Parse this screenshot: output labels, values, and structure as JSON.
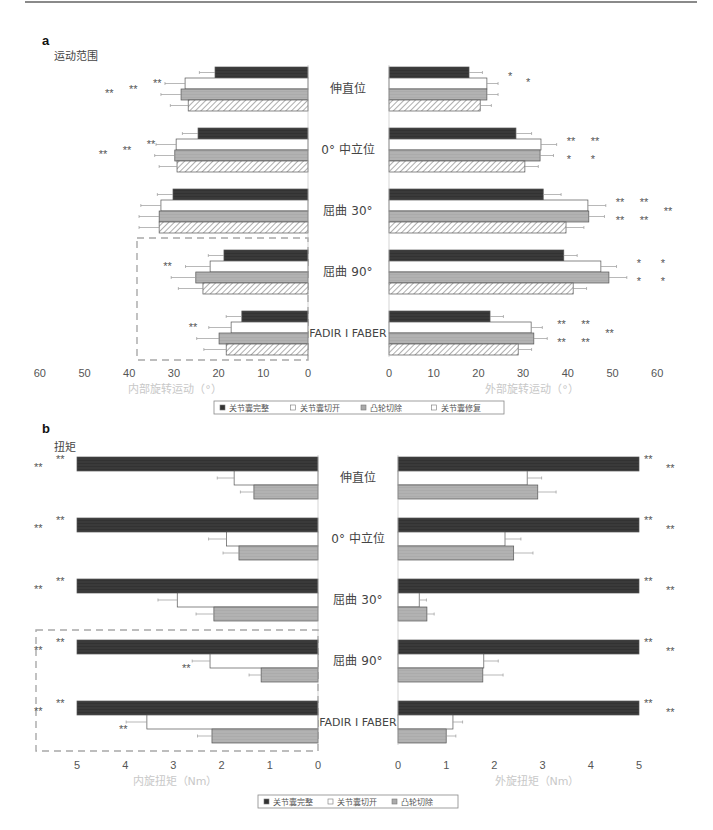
{
  "panels": {
    "a": {
      "letter": "a",
      "title": "运动范围",
      "left_axis_title": "内部旋转运动（°）",
      "right_axis_title": "外部旋转运动（°）",
      "left_ticks": [
        "60",
        "50",
        "40",
        "30",
        "20",
        "10",
        "0"
      ],
      "right_ticks": [
        "0",
        "10",
        "20",
        "30",
        "40",
        "50",
        "60"
      ],
      "legend": [
        "关节囊完整",
        "关节囊切开",
        "凸轮切除",
        "关节囊修复"
      ]
    },
    "b": {
      "letter": "b",
      "title": "扭矩",
      "left_axis_title": "内旋扭矩（Nm）",
      "right_axis_title": "外旋扭矩（Nm）",
      "left_ticks": [
        "5",
        "4",
        "3",
        "2",
        "1",
        "0"
      ],
      "right_ticks": [
        "0",
        "1",
        "2",
        "3",
        "4",
        "5"
      ],
      "legend": [
        "关节囊完整",
        "关节囊切开",
        "凸轮切除"
      ]
    }
  },
  "categories": [
    "伸直位",
    "0° 中立位",
    "屈曲 30°",
    "屈曲 90°",
    "FADIR I FABER"
  ],
  "colors": {
    "intact": "#3a3a3a",
    "capsulotomy": "#ffffff",
    "cam_resection": "#b0b0b0",
    "repair_hatch": "#6a6a6a",
    "bar_edge": "#555555",
    "dashed_box": "#a8a8a8",
    "axis_title": "#c8c8c8"
  },
  "chart_data": [
    {
      "type": "bar",
      "orientation": "horizontal-butterfly",
      "title": "运动范围",
      "panel": "a",
      "categories": [
        "伸直位",
        "0° 中立位",
        "屈曲 30°",
        "屈曲 90°",
        "FADIR I FABER"
      ],
      "left": {
        "xlabel": "内部旋转运动（°）",
        "xlim": [
          60,
          0
        ],
        "ticks": [
          60,
          50,
          40,
          30,
          20,
          10,
          0
        ],
        "series": [
          {
            "name": "关节囊完整",
            "values": [
              20.8,
              24.6,
              30.2,
              18.8,
              14.8
            ],
            "errors": [
              3.5,
              3.5,
              3.5,
              3.5,
              3.5
            ]
          },
          {
            "name": "关节囊切开",
            "values": [
              27.5,
              29.5,
              32.9,
              21.9,
              17.2
            ],
            "errors": [
              4.5,
              4.5,
              4.5,
              5.5,
              5.0
            ]
          },
          {
            "name": "凸轮切除",
            "values": [
              28.4,
              29.8,
              33.3,
              25.1,
              19.9
            ],
            "errors": [
              4.5,
              4.5,
              4.5,
              5.5,
              5.0
            ]
          },
          {
            "name": "关节囊修复",
            "values": [
              26.8,
              29.3,
              33.3,
              23.5,
              18.3
            ],
            "errors": [
              4.0,
              4.0,
              4.5,
              5.5,
              5.0
            ]
          }
        ],
        "significance": [
          "** ** **",
          "** ** **",
          "",
          "**",
          "**"
        ],
        "highlight_box": [
          "屈曲 90°",
          "FADIR I FABER"
        ]
      },
      "right": {
        "xlabel": "外部旋转运动（°）",
        "xlim": [
          0,
          60
        ],
        "ticks": [
          0,
          10,
          20,
          30,
          40,
          50,
          60
        ],
        "series": [
          {
            "name": "关节囊完整",
            "values": [
              17.9,
              28.4,
              34.5,
              39.1,
              22.6
            ],
            "errors": [
              3.0,
              3.5,
              4.0,
              3.0,
              3.0
            ]
          },
          {
            "name": "关节囊切开",
            "values": [
              21.9,
              34.0,
              44.5,
              47.4,
              31.8
            ],
            "errors": [
              2.5,
              3.5,
              4.0,
              3.5,
              2.5
            ]
          },
          {
            "name": "凸轮切除",
            "values": [
              21.9,
              33.8,
              44.7,
              49.2,
              32.4
            ],
            "errors": [
              2.5,
              3.0,
              3.5,
              4.0,
              3.0
            ]
          },
          {
            "name": "关节囊修复",
            "values": [
              20.4,
              30.4,
              39.6,
              41.2,
              28.9
            ],
            "errors": [
              2.5,
              3.0,
              4.0,
              3.0,
              3.0
            ]
          }
        ],
        "significance": [
          "* *",
          "** * ** *",
          "** ** ** ** **",
          "* * * *",
          "** ** ** ** **"
        ]
      },
      "legend_position": "bottom-center"
    },
    {
      "type": "bar",
      "orientation": "horizontal-butterfly",
      "title": "扭矩",
      "panel": "b",
      "categories": [
        "伸直位",
        "0° 中立位",
        "屈曲 30°",
        "屈曲 90°",
        "FADIR I FABER"
      ],
      "left": {
        "xlabel": "内旋扭矩（Nm）",
        "xlim": [
          5,
          0
        ],
        "ticks": [
          5,
          4,
          3,
          2,
          1,
          0
        ],
        "series": [
          {
            "name": "关节囊完整",
            "values": [
              5,
              5,
              5,
              5,
              5
            ],
            "errors": [
              0,
              0,
              0,
              0,
              0
            ]
          },
          {
            "name": "关节囊切开",
            "values": [
              1.74,
              1.9,
              2.92,
              2.24,
              3.55
            ],
            "errors": [
              0.35,
              0.37,
              0.4,
              0.37,
              0.43
            ]
          },
          {
            "name": "凸轮切除",
            "values": [
              1.33,
              1.64,
              2.16,
              1.18,
              2.2
            ],
            "errors": [
              0.28,
              0.33,
              0.37,
              0.25,
              0.3
            ]
          }
        ],
        "significance": [
          "** **",
          "** **",
          "** **",
          "** ** **",
          "** ** **"
        ],
        "highlight_box": [
          "屈曲 90°",
          "FADIR I FABER"
        ]
      },
      "right": {
        "xlabel": "外旋扭矩（Nm）",
        "xlim": [
          0,
          5
        ],
        "ticks": [
          0,
          1,
          2,
          3,
          4,
          5
        ],
        "series": [
          {
            "name": "关节囊完整",
            "values": [
              5,
              5,
              5,
              5,
              5
            ],
            "errors": [
              0,
              0,
              0,
              0,
              0
            ]
          },
          {
            "name": "关节囊切开",
            "values": [
              2.68,
              2.22,
              0.44,
              1.78,
              1.14
            ],
            "errors": [
              0.3,
              0.33,
              0.15,
              0.3,
              0.2
            ]
          },
          {
            "name": "凸轮切除",
            "values": [
              2.9,
              2.4,
              0.6,
              1.76,
              1.0
            ],
            "errors": [
              0.38,
              0.4,
              0.15,
              0.42,
              0.2
            ]
          }
        ],
        "significance": [
          "** **",
          "** **",
          "** **",
          "** **",
          "** **"
        ]
      },
      "legend_position": "bottom-center"
    }
  ]
}
